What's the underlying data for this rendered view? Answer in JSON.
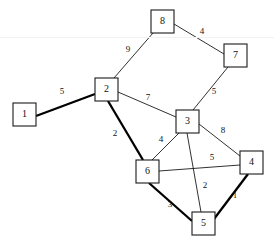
{
  "diagram": {
    "background_color": "#ffffff",
    "stroke_color": "#1a1a1a",
    "node_size": 23,
    "nodes": [
      {
        "id": "1",
        "label": "1",
        "x": 13,
        "y": 103
      },
      {
        "id": "2",
        "label": "2",
        "x": 95,
        "y": 78
      },
      {
        "id": "3",
        "label": "3",
        "x": 176,
        "y": 110
      },
      {
        "id": "4",
        "label": "4",
        "x": 240,
        "y": 151
      },
      {
        "id": "5",
        "label": "5",
        "x": 192,
        "y": 212
      },
      {
        "id": "6",
        "label": "6",
        "x": 136,
        "y": 160
      },
      {
        "id": "7",
        "label": "7",
        "x": 224,
        "y": 44
      },
      {
        "id": "8",
        "label": "8",
        "x": 151,
        "y": 10
      }
    ],
    "edges": [
      {
        "from": "1",
        "to": "2",
        "weight": "5",
        "x1": 36,
        "y1": 116,
        "x2": 95,
        "y2": 94,
        "bold": true,
        "label_x": 62,
        "label_y": 92
      },
      {
        "from": "2",
        "to": "8",
        "weight": "9",
        "x1": 114,
        "y1": 78,
        "x2": 153,
        "y2": 33,
        "bold": false,
        "label_x": 128,
        "label_y": 50
      },
      {
        "from": "8",
        "to": "7",
        "weight": "4",
        "x1": 174,
        "y1": 24,
        "x2": 224,
        "y2": 54,
        "bold": false,
        "label_x": 202,
        "label_y": 32
      },
      {
        "from": "7",
        "to": "3",
        "weight": "5",
        "x1": 228,
        "y1": 67,
        "x2": 193,
        "y2": 110,
        "bold": false,
        "label_x": 214,
        "label_y": 92
      },
      {
        "from": "2",
        "to": "3",
        "weight": "7",
        "x1": 118,
        "y1": 92,
        "x2": 176,
        "y2": 117,
        "bold": false,
        "label_x": 148,
        "label_y": 98
      },
      {
        "from": "2",
        "to": "6",
        "weight": "2",
        "x1": 108,
        "y1": 101,
        "x2": 143,
        "y2": 160,
        "bold": true,
        "label_x": 115,
        "label_y": 134
      },
      {
        "from": "3",
        "to": "6",
        "weight": "4",
        "x1": 179,
        "y1": 133,
        "x2": 152,
        "y2": 160,
        "bold": false,
        "label_x": 161,
        "label_y": 140
      },
      {
        "from": "3",
        "to": "4",
        "weight": "8",
        "x1": 199,
        "y1": 124,
        "x2": 240,
        "y2": 156,
        "bold": false,
        "label_x": 223,
        "label_y": 131
      },
      {
        "from": "6",
        "to": "4",
        "weight": "5",
        "x1": 159,
        "y1": 171,
        "x2": 240,
        "y2": 165,
        "bold": false,
        "label_x": 212,
        "label_y": 158
      },
      {
        "from": "3",
        "to": "5",
        "weight": "2",
        "x1": 187,
        "y1": 133,
        "x2": 201,
        "y2": 212,
        "bold": false,
        "label_x": 205,
        "label_y": 186
      },
      {
        "from": "6",
        "to": "5",
        "weight": "3",
        "x1": 149,
        "y1": 183,
        "x2": 192,
        "y2": 221,
        "bold": true,
        "label_x": 170,
        "label_y": 205
      },
      {
        "from": "5",
        "to": "4",
        "weight": "1",
        "x1": 214,
        "y1": 219,
        "x2": 248,
        "y2": 174,
        "bold": true,
        "label_x": 235,
        "label_y": 196
      }
    ],
    "rules": [
      {
        "y": 37,
        "color": "#f2f2f2"
      }
    ]
  }
}
